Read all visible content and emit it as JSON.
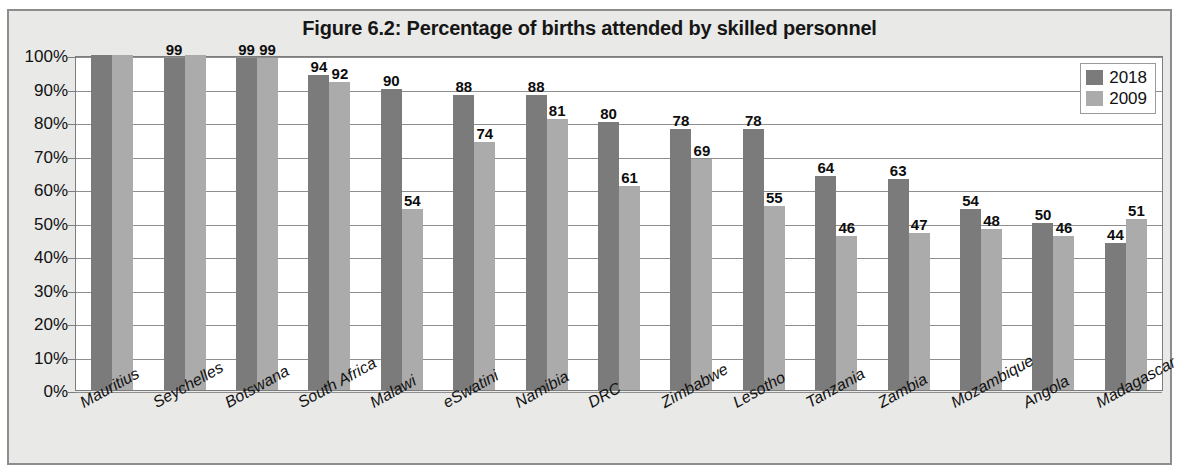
{
  "figure": {
    "title": "Figure 6.2: Percentage of births attended by skilled personnel",
    "border_color": "#8d8d8d",
    "panel_background": "#e9e9e7",
    "plot_background": "#ffffff"
  },
  "legend": {
    "position": "top-right",
    "entries": [
      {
        "label": "2018",
        "color": "#7b7b7b"
      },
      {
        "label": "2009",
        "color": "#ababab"
      }
    ]
  },
  "chart_data": {
    "type": "bar",
    "title": "Figure 6.2: Percentage of births attended by skilled personnel",
    "xlabel": "",
    "ylabel": "",
    "ylim": [
      0,
      100
    ],
    "grid": true,
    "legend_position": "top-right",
    "yticks": [
      "0%",
      "10%",
      "20%",
      "30%",
      "40%",
      "50%",
      "60%",
      "70%",
      "80%",
      "90%",
      "100%"
    ],
    "categories": [
      "Mauritius",
      "Seychelles",
      "Botswana",
      "South Africa",
      "Malawi",
      "eSwatini",
      "Namibia",
      "DRC",
      "Zimbabwe",
      "Lesotho",
      "Tanzania",
      "Zambia",
      "Mozambique",
      "Angola",
      "Madagascar"
    ],
    "series": [
      {
        "name": "2018",
        "color": "#7b7b7b",
        "values": [
          100,
          99,
          99,
          94,
          90,
          88,
          88,
          80,
          78,
          78,
          64,
          63,
          54,
          50,
          44
        ],
        "labels": [
          "",
          "99",
          "99",
          "94",
          "90",
          "88",
          "88",
          "80",
          "78",
          "78",
          "64",
          "63",
          "54",
          "50",
          "44"
        ]
      },
      {
        "name": "2009",
        "color": "#ababab",
        "values": [
          100,
          100,
          99,
          92,
          54,
          74,
          81,
          61,
          69,
          55,
          46,
          47,
          48,
          46,
          51
        ],
        "labels": [
          "",
          "",
          "99",
          "92",
          "54",
          "74",
          "81",
          "61",
          "69",
          "55",
          "46",
          "47",
          "48",
          "46",
          "51"
        ]
      }
    ]
  }
}
